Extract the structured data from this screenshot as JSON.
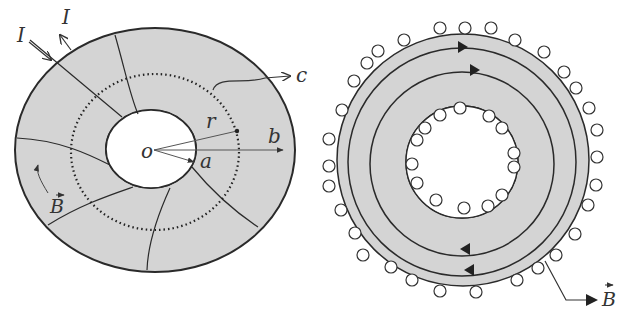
{
  "figure_left": {
    "labels": {
      "current_in": "I",
      "current_out": "I",
      "c": "c",
      "r": "r",
      "b": "b",
      "a": "a",
      "o": "o",
      "B": "B"
    },
    "colors": {
      "fill": "#d4d4d4",
      "stroke": "#2a2a2a"
    }
  },
  "figure_right": {
    "labels": {
      "B": "B"
    },
    "colors": {
      "fill": "#d4d4d4",
      "stroke": "#2a2a2a"
    }
  }
}
